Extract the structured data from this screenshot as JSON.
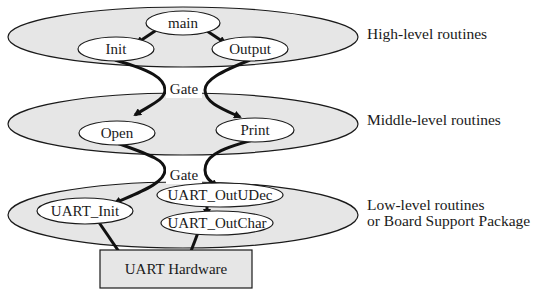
{
  "layers": [
    {
      "id": "high",
      "label": "High-level routines",
      "label_lines": [
        "High-level routines"
      ]
    },
    {
      "id": "middle",
      "label": "Middle-level routines",
      "label_lines": [
        "Middle-level routines"
      ]
    },
    {
      "id": "low",
      "label": "Low-level routines or Board Support Package",
      "label_lines": [
        "Low-level routines",
        "or Board Support Package"
      ]
    }
  ],
  "nodes": {
    "main": "main",
    "init": "Init",
    "output": "Output",
    "open": "Open",
    "print": "Print",
    "uart_init": "UART_Init",
    "uart_outudec": "UART_OutUDec",
    "uart_outchar": "UART_OutChar",
    "hardware": "UART Hardware"
  },
  "gates": {
    "gate1": "Gate",
    "gate2": "Gate"
  },
  "edges": [
    [
      "main",
      "init"
    ],
    [
      "main",
      "output"
    ],
    [
      "init",
      "open"
    ],
    [
      "output",
      "print"
    ],
    [
      "open",
      "uart_init"
    ],
    [
      "print",
      "uart_outudec"
    ],
    [
      "uart_outudec",
      "uart_outchar"
    ],
    [
      "uart_init",
      "hardware"
    ],
    [
      "uart_outchar",
      "hardware"
    ]
  ],
  "colors": {
    "layer_fill": "#e6e6e6",
    "node_fill": "#ffffff",
    "stroke": "#1a1a1a",
    "box_fill": "#e6e6e6"
  }
}
